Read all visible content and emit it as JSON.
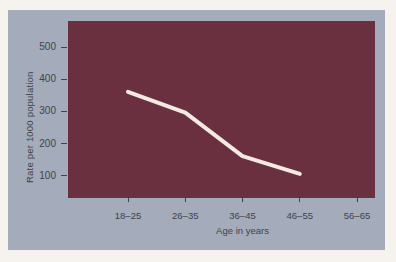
{
  "colors": {
    "page_bg": "#f6f3ee",
    "panel_bg": "#a4abba",
    "plot_bg": "#6b3040",
    "line": "#f3eae0",
    "text": "#3f434c"
  },
  "chart_data": {
    "type": "line",
    "categories": [
      "18–25",
      "26–35",
      "36–45",
      "46–55",
      "56–65"
    ],
    "series": [
      {
        "name": "Rate per 1000 population",
        "values": [
          330,
          265,
          130,
          75,
          null
        ]
      }
    ],
    "xlabel": "Age in years",
    "ylabel": "Rate per 1000 population",
    "yticks": [
      100,
      200,
      300,
      400,
      500
    ],
    "ylim": [
      0,
      550
    ],
    "grid": false,
    "legend": "none",
    "line_width": 4
  }
}
